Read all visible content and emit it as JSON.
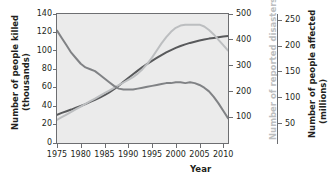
{
  "chart_data": {
    "type": "line",
    "title": "",
    "xlabel": "Year",
    "grid": false,
    "legend_position": "none",
    "x": [
      1975,
      1976,
      1977,
      1978,
      1979,
      1980,
      1981,
      1982,
      1983,
      1984,
      1985,
      1986,
      1987,
      1988,
      1989,
      1990,
      1991,
      1992,
      1993,
      1994,
      1995,
      1996,
      1997,
      1998,
      1999,
      2000,
      2001,
      2002,
      2003,
      2004,
      2005,
      2006,
      2007,
      2008,
      2009,
      2010,
      2011
    ],
    "xticks": [
      "1975",
      "1980",
      "1985",
      "1990",
      "1995",
      "2000",
      "2005",
      "2010"
    ],
    "xlim": [
      1975,
      2011
    ],
    "axes": [
      {
        "id": "left",
        "label_line1": "Number of people killed",
        "label_line2": "(thousands)",
        "ticks": [
          "0",
          "20",
          "40",
          "60",
          "80",
          "100",
          "120",
          "140"
        ],
        "lim": [
          0,
          140
        ],
        "color": "#231f20"
      },
      {
        "id": "right-inner",
        "label_line1": "Number of reported disasters",
        "ticks": [
          "100",
          "200",
          "300",
          "400",
          "500"
        ],
        "lim": [
          0,
          540
        ],
        "color": "#bcbec0"
      },
      {
        "id": "right-outer",
        "label_line1": "Number of people affected",
        "label_line2": "(millions)",
        "ticks": [
          "50",
          "100",
          "150",
          "200",
          "250"
        ],
        "lim": [
          0,
          290
        ],
        "color": "#231f20"
      }
    ],
    "series": [
      {
        "name": "Number of reported disasters",
        "axis": "right-inner",
        "color": "#58595b",
        "values": [
          118,
          126,
          133,
          140,
          148,
          155,
          163,
          172,
          181,
          190,
          200,
          212,
          225,
          240,
          256,
          272,
          288,
          303,
          318,
          331,
          344,
          356,
          368,
          379,
          389,
          398,
          406,
          413,
          419,
          424,
          429,
          433,
          437,
          440,
          443,
          446,
          448
        ]
      },
      {
        "name": "Number of people killed (thousands)",
        "axis": "left",
        "color": "#808285",
        "values": [
          122,
          114,
          106,
          98,
          92,
          86,
          82,
          80,
          78,
          74,
          70,
          66,
          62,
          59,
          58,
          58,
          58,
          59,
          60,
          61,
          62,
          63,
          64,
          65,
          65,
          66,
          66,
          65,
          66,
          65,
          63,
          60,
          56,
          50,
          43,
          35,
          27
        ]
      },
      {
        "name": "Number of people affected (millions)",
        "axis": "right-outer",
        "color": "#bcbec0",
        "values": [
          52,
          58,
          64,
          70,
          76,
          82,
          88,
          94,
          100,
          106,
          112,
          118,
          124,
          130,
          136,
          142,
          148,
          156,
          166,
          178,
          192,
          208,
          224,
          238,
          250,
          259,
          264,
          266,
          266,
          266,
          266,
          262,
          254,
          244,
          232,
          220,
          208
        ]
      }
    ]
  },
  "xaxis": {
    "title": "Year",
    "ticks": [
      "1975",
      "1980",
      "1985",
      "1990",
      "1995",
      "2000",
      "2005",
      "2010"
    ]
  },
  "left_axis": {
    "title_line1": "Number of people killed",
    "title_line2": "(thousands)",
    "ticks": [
      "140",
      "120",
      "100",
      "80",
      "60",
      "40",
      "20",
      "0"
    ]
  },
  "right_inner_axis": {
    "title": "Number of reported disasters",
    "ticks": [
      "500",
      "400",
      "300",
      "200",
      "100"
    ]
  },
  "right_outer_axis": {
    "title_line1": "Number of people affected",
    "title_line2": "(millions)",
    "ticks": [
      "250",
      "200",
      "150",
      "100",
      "50"
    ]
  }
}
